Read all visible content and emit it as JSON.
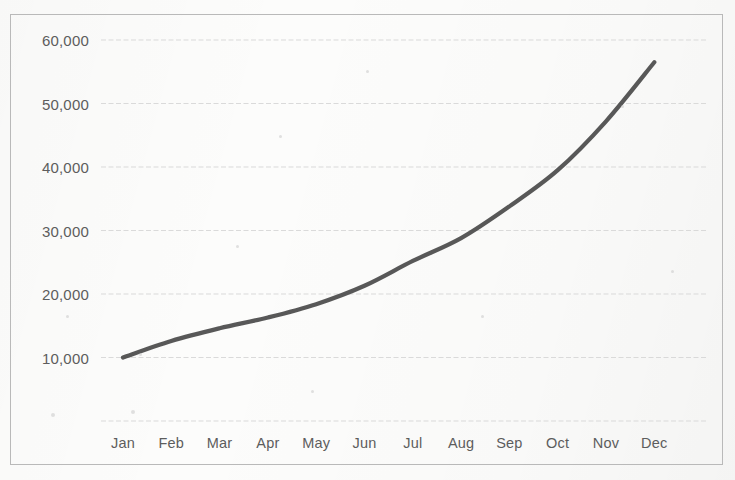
{
  "chart_data": {
    "type": "line",
    "title": "",
    "subtitle": "",
    "xlabel": "",
    "ylabel": "",
    "categories": [
      "Jan",
      "Feb",
      "Mar",
      "Apr",
      "May",
      "Jun",
      "Jul",
      "Aug",
      "Sep",
      "Oct",
      "Nov",
      "Dec"
    ],
    "values": [
      10000,
      12600,
      14600,
      16300,
      18400,
      21300,
      25200,
      28800,
      33800,
      39500,
      47200,
      56500
    ],
    "series": [
      {
        "name": "",
        "values": [
          10000,
          12600,
          14600,
          16300,
          18400,
          21300,
          25200,
          28800,
          33800,
          39500,
          47200,
          56500
        ]
      }
    ],
    "ylim": [
      0,
      60000
    ],
    "ytick_values": [
      0,
      10000,
      20000,
      30000,
      40000,
      50000,
      60000
    ],
    "ytick_labels": [
      "",
      "10,000",
      "20,000",
      "30,000",
      "40,000",
      "50,000",
      "60,000"
    ],
    "grid": true,
    "grid_axis": "y",
    "legend": false,
    "legend_position": "none",
    "markers": false,
    "line_color": "#4a4a4a",
    "grid_color": "#d5d5d5",
    "text_color": "#5d5d5d",
    "border_color": "#b9b9b9",
    "background_color": "#fcfcfb"
  }
}
